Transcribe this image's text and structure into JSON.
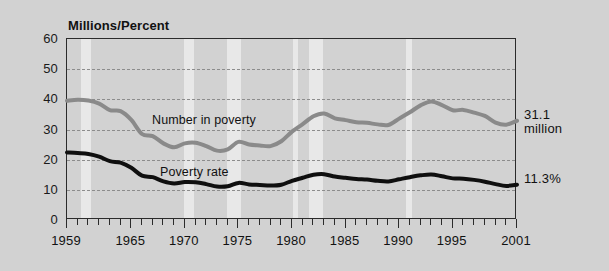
{
  "figure": {
    "background_color": "#d2d2d2",
    "plot_border_color": "#2b2b2b",
    "gridline_color": "#8c8c8c",
    "recession_band_color": "#e8e8e8"
  },
  "axis": {
    "y_title": "Millions/Percent",
    "y_ticks": [
      0,
      10,
      20,
      30,
      40,
      50,
      60
    ],
    "x_tick_labels": [
      "1959",
      "1965",
      "1970",
      "1975",
      "1980",
      "1985",
      "1990",
      "1995",
      "2001"
    ],
    "x_tick_years": [
      1959,
      1965,
      1970,
      1975,
      1980,
      1985,
      1990,
      1995,
      2001
    ]
  },
  "labels": {
    "number_in_poverty": "Number in poverty",
    "poverty_rate": "Poverty rate"
  },
  "annotations": {
    "number_end_value": "31.1\nmillion",
    "rate_end_value": "11.3%"
  },
  "chart_data": {
    "type": "line",
    "title": "",
    "xlabel": "",
    "ylabel": "Millions/Percent",
    "xlim": [
      1959,
      2001
    ],
    "ylim": [
      0,
      60
    ],
    "grid": true,
    "legend": "inline-annotations",
    "x": [
      1959,
      1960,
      1961,
      1962,
      1963,
      1964,
      1965,
      1966,
      1967,
      1968,
      1969,
      1970,
      1971,
      1972,
      1973,
      1974,
      1975,
      1976,
      1977,
      1978,
      1979,
      1980,
      1981,
      1982,
      1983,
      1984,
      1985,
      1986,
      1987,
      1988,
      1989,
      1990,
      1991,
      1992,
      1993,
      1994,
      1995,
      1996,
      1997,
      1998,
      1999,
      2000,
      2001
    ],
    "series": [
      {
        "name": "Number in poverty",
        "unit": "millions",
        "color": "#8a8a8a",
        "end_label": "31.1 million",
        "values": [
          39.5,
          39.9,
          39.6,
          38.6,
          36.4,
          36.1,
          33.2,
          28.5,
          27.8,
          25.4,
          24.1,
          25.4,
          25.6,
          24.5,
          23.0,
          23.4,
          25.9,
          25.0,
          24.7,
          24.5,
          26.1,
          29.3,
          31.8,
          34.4,
          35.3,
          33.7,
          33.1,
          32.4,
          32.2,
          31.7,
          31.5,
          33.6,
          35.7,
          38.0,
          39.3,
          38.1,
          36.4,
          36.5,
          35.6,
          34.5,
          32.3,
          31.6,
          32.9
        ]
      },
      {
        "name": "Poverty rate",
        "unit": "percent",
        "color": "#0f0f0f",
        "end_label": "11.3%",
        "values": [
          22.4,
          22.2,
          21.9,
          21.0,
          19.5,
          19.0,
          17.3,
          14.7,
          14.2,
          12.8,
          12.1,
          12.6,
          12.5,
          11.9,
          11.1,
          11.2,
          12.3,
          11.8,
          11.6,
          11.4,
          11.7,
          13.0,
          14.0,
          15.0,
          15.2,
          14.4,
          14.0,
          13.6,
          13.4,
          13.0,
          12.8,
          13.5,
          14.2,
          14.8,
          15.1,
          14.5,
          13.8,
          13.7,
          13.3,
          12.7,
          11.9,
          11.3,
          11.7
        ]
      }
    ],
    "recession_bands": [
      {
        "start": 1960.3,
        "end": 1961.2
      },
      {
        "start": 1969.9,
        "end": 1970.9
      },
      {
        "start": 1973.9,
        "end": 1975.2
      },
      {
        "start": 1980.1,
        "end": 1980.6
      },
      {
        "start": 1981.6,
        "end": 1982.9
      },
      {
        "start": 1990.6,
        "end": 1991.2
      }
    ]
  }
}
